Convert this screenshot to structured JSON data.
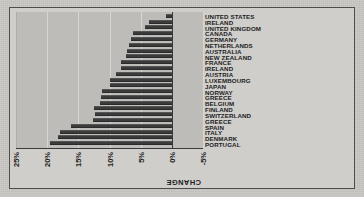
{
  "chart_data": {
    "type": "bar",
    "title": "",
    "xlabel": "",
    "ylabel": "CHANGE",
    "ylim": [
      -5,
      25
    ],
    "ytick_labels": [
      "25%",
      "20%",
      "15%",
      "10%",
      "5%",
      "0%",
      "-5%"
    ],
    "ytick_values": [
      25,
      20,
      15,
      10,
      5,
      0,
      -5
    ],
    "grid": true,
    "legend": "none",
    "orientation": "page-rotated-90-ccw",
    "categories": [
      "PORTUGAL",
      "DENMARK",
      "ITALY",
      "SPAIN",
      "GREECE",
      "SWITZERLAND",
      "FINLAND",
      "BELGIUM",
      "GREECE",
      "NORWAY",
      "JAPAN",
      "LUXEMBOURG",
      "AUSTRIA",
      "IRELAND",
      "FRANCE",
      "NEW ZEALAND",
      "AUSTRALIA",
      "NETHERLANDS",
      "GERMANY",
      "CANADA",
      "UNITED KINGDOM",
      "IRELAND",
      "UNITED STATES"
    ],
    "values": [
      19.5,
      18.2,
      18.0,
      16.2,
      12.6,
      12.4,
      12.5,
      11.6,
      11.4,
      11.2,
      10.0,
      9.9,
      9.0,
      8.2,
      8.1,
      7.3,
      7.2,
      6.9,
      6.5,
      6.2,
      4.3,
      3.6,
      1.0
    ],
    "series": [
      {
        "name": "CHANGE",
        "values": [
          19.5,
          18.2,
          18.0,
          16.2,
          12.6,
          12.4,
          12.5,
          11.6,
          11.4,
          11.2,
          10.0,
          9.9,
          9.0,
          8.2,
          8.1,
          7.3,
          7.2,
          6.9,
          6.5,
          6.2,
          4.3,
          3.6,
          1.0
        ]
      }
    ],
    "colors": {
      "bar": "#3b3b3b",
      "plot_background": "#bdbcb8",
      "figure_background": "#cfcecb",
      "page_background": "#c9c8c4",
      "axis": "#3a3a3a",
      "gridline": "#d7d6d2",
      "text": "#1d1d1d"
    }
  }
}
